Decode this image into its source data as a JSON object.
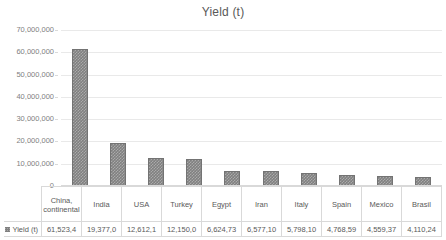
{
  "chart_data": {
    "type": "bar",
    "title": "Yield (t)",
    "xlabel": "",
    "ylabel": "",
    "ylim": [
      0,
      70000000
    ],
    "ytick_step": 10000000,
    "ytick_labels": [
      "70,000,000",
      "60,000,000",
      "50,000,000",
      "40,000,000",
      "30,000,000",
      "20,000,000",
      "10,000,000",
      "0"
    ],
    "ytick_values": [
      70000000,
      60000000,
      50000000,
      40000000,
      30000000,
      20000000,
      10000000,
      0
    ],
    "grid": true,
    "legend_position": "data-table",
    "series": [
      {
        "name": "Yield (t)",
        "values": [
          61523400,
          19377000,
          12612100,
          12150000,
          6624730,
          6577100,
          5798100,
          4768590,
          4559370,
          4110240
        ]
      }
    ],
    "categories": [
      "China, continental",
      "India",
      "USA",
      "Turkey",
      "Egypt",
      "Iran",
      "Italy",
      "Spain",
      "Mexico",
      "Brasil"
    ],
    "value_labels": [
      "61,523,4",
      "19,377,0",
      "12,612,1",
      "12,150,0",
      "6,624,73",
      "6,577,10",
      "5,798,10",
      "4,768,59",
      "4,559,37",
      "4,110,24"
    ],
    "bar_color": "#808080",
    "bar_border_color": "#737373",
    "grid_color": "#e9e9e9",
    "text_color": "#595959"
  },
  "legend": {
    "series_label": "Yield (t)",
    "marker": "legend-swatch-icon"
  }
}
